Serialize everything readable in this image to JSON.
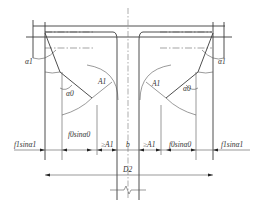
{
  "diagram": {
    "type": "engineering cross-section dimension drawing",
    "labels": {
      "alpha1_left": "α1",
      "alpha0_left": "α0",
      "A1_left": "A1",
      "alpha1_right": "α1",
      "alpha0_right": "α0",
      "A1_right": "A1",
      "b": "b",
      "D2": "D2"
    },
    "dimension_row": [
      {
        "label": "f1sinα1",
        "position": "left-outer"
      },
      {
        "label": "f0sinα0",
        "position": "left-inner"
      },
      {
        "label": "≥A1",
        "position": "left-gap"
      },
      {
        "label": "b",
        "position": "center"
      },
      {
        "label": "≥A1",
        "position": "right-gap"
      },
      {
        "label": "f0sinα0",
        "position": "right-inner"
      },
      {
        "label": "f1sinα1",
        "position": "right-outer"
      }
    ],
    "overall_dimension": "D2",
    "line_color": "#3a3a3a",
    "background": "#ffffff"
  }
}
